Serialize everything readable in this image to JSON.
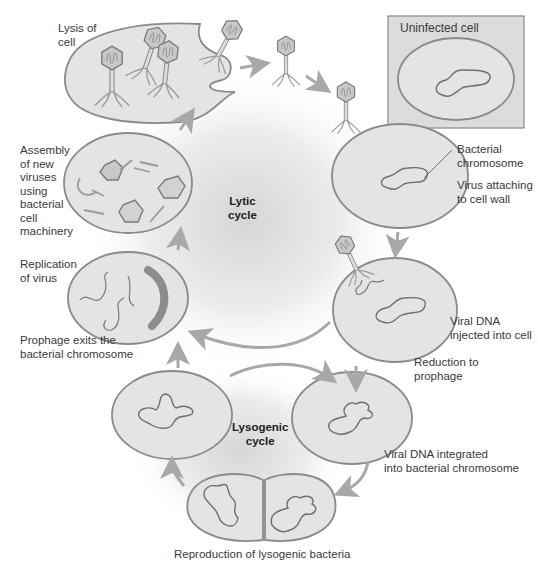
{
  "diagram": {
    "colors": {
      "cell_fill": "#e4e4e4",
      "cell_stroke": "#8a8a8a",
      "chromosome_stroke": "#6f6f6f",
      "phage_head_fill": "#c8c8c8",
      "phage_stroke": "#7a7a7a",
      "arrow": "#a8a8a8",
      "uninfected_box_fill": "#dcdcdc",
      "replicating_dna": "#8c8c8c",
      "text": "#3a3a3a"
    },
    "cycles": {
      "lytic": "Lytic\ncycle",
      "lysogenic": "Lysogenic\ncycle"
    },
    "inset": {
      "title": "Uninfected cell"
    },
    "stages": [
      {
        "id": "lysis",
        "label": "Lysis of\ncell"
      },
      {
        "id": "attach",
        "label": "Virus attaching\nto cell wall"
      },
      {
        "id": "chromosome",
        "label": "Bacterial\nchromosome"
      },
      {
        "id": "inject",
        "label": "Viral DNA\ninjected into cell"
      },
      {
        "id": "reduction",
        "label": "Reduction to\nprophage"
      },
      {
        "id": "integrated",
        "label": "Viral DNA integrated\ninto bacterial chromosome"
      },
      {
        "id": "reproduction",
        "label": "Reproduction of lysogenic bacteria"
      },
      {
        "id": "exit",
        "label": "Prophage exits the\nbacterial chromosome"
      },
      {
        "id": "replication",
        "label": "Replication\nof virus"
      },
      {
        "id": "assembly",
        "label": "Assembly\nof new\nviruses\nusing\nbacterial\ncell\nmachinery"
      }
    ]
  }
}
